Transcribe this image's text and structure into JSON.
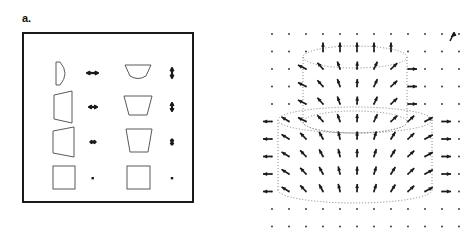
{
  "figure": {
    "panels": [
      {
        "id": "a",
        "label": "a.",
        "description": "Bordered box containing four rows of deforming cross-section shapes paired with displacement arrows",
        "frame": {
          "x": 22,
          "y": 32,
          "width": 172,
          "height": 171,
          "border_color": "#1a1a1a",
          "border_width": 2,
          "fill": "#ffffff"
        },
        "columns": [
          {
            "name": "side-view-shape",
            "x_center": 62
          },
          {
            "name": "horizontal-arrow",
            "x_center": 92
          },
          {
            "name": "front-view-shape",
            "x_center": 138
          },
          {
            "name": "vertical-arrow",
            "x_center": 172
          }
        ],
        "rows": [
          {
            "index": 1,
            "y_center": 73,
            "side_shape": "thin-wedge-curved-edge",
            "front_shape": "shallow-curved-trapezoid",
            "h_arrow": {
              "type": "double-headed",
              "length": 11,
              "orientation": "horizontal"
            },
            "v_arrow": {
              "type": "double-headed",
              "length": 10,
              "orientation": "vertical"
            }
          },
          {
            "index": 2,
            "y_center": 107,
            "side_shape": "medium-wedge",
            "front_shape": "medium-trapezoid",
            "h_arrow": {
              "type": "double-headed",
              "length": 8,
              "orientation": "horizontal"
            },
            "v_arrow": {
              "type": "double-headed",
              "length": 8,
              "orientation": "vertical"
            }
          },
          {
            "index": 3,
            "y_center": 142,
            "side_shape": "wide-trapezoid",
            "front_shape": "tall-trapezoid",
            "h_arrow": {
              "type": "double-headed",
              "length": 6,
              "orientation": "horizontal"
            },
            "v_arrow": {
              "type": "double-headed",
              "length": 6,
              "orientation": "vertical"
            }
          },
          {
            "index": 4,
            "y_center": 178,
            "side_shape": "square",
            "front_shape": "square",
            "h_arrow": {
              "type": "dot",
              "length": 2,
              "orientation": "none"
            },
            "v_arrow": {
              "type": "dot",
              "length": 2,
              "orientation": "none"
            }
          }
        ],
        "shape_stroke": "#5a5a5a",
        "arrow_color": "#1a1a1a"
      },
      {
        "id": "b",
        "label": "b.",
        "description": "Vector displacement field on a regular dot grid overlaid on a dotted two-tier stepped cylinder outline",
        "grid": {
          "origin_x": 272,
          "origin_y": 34,
          "spacing_x": 17,
          "spacing_y": 17.5,
          "cols": 12,
          "rows": 12,
          "dot_color": "#2a2a2a",
          "dot_radius": 0.9
        },
        "cylinders": [
          {
            "name": "upper-cylinder",
            "center_x": 355,
            "top_y": 57,
            "bottom_y": 122,
            "radius_x": 52,
            "radius_y": 11
          },
          {
            "name": "lower-cylinder",
            "center_x": 355,
            "top_y": 120,
            "bottom_y": 190,
            "radius_x": 77,
            "radius_y": 13
          }
        ],
        "outline_style": "dotted",
        "outline_color": "#8a8a8a",
        "vector_color": "#1a1a1a",
        "reference_arrow": {
          "name": "scale-reference-arrow",
          "x": 452,
          "y": 36,
          "length": 9,
          "angle_deg": 250
        }
      }
    ]
  }
}
